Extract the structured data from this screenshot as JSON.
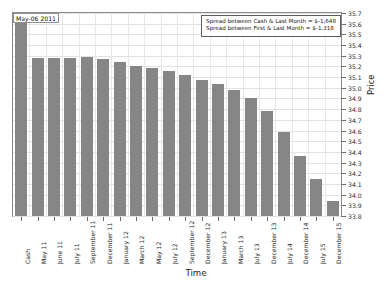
{
  "chart_data": {
    "type": "bar",
    "title": "",
    "xlabel": "Time",
    "ylabel": "Price",
    "ylim": [
      33.8,
      35.7
    ],
    "ytick_step": 0.1,
    "grid": true,
    "legend_position": "none",
    "bar_color": "#868686",
    "categories": [
      "Cash",
      "May 11",
      "June 11",
      "July 11",
      "September 11",
      "December 11",
      "January 12",
      "March 12",
      "May 12",
      "July 12",
      "September 12",
      "December 12",
      "January 13",
      "March 13",
      "July 13",
      "December 13",
      "July 14",
      "December 14",
      "July 15",
      "December 15"
    ],
    "values": [
      35.62,
      35.28,
      35.28,
      35.28,
      35.29,
      35.27,
      35.24,
      35.2,
      35.19,
      35.16,
      35.12,
      35.07,
      35.04,
      34.98,
      34.9,
      34.78,
      34.59,
      34.36,
      34.15,
      33.94
    ],
    "ytick_labels": [
      "35.7",
      "35.6",
      "35.5",
      "35.4",
      "35.3",
      "35.2",
      "35.1",
      "35.0",
      "34.9",
      "34.8",
      "34.7",
      "34.6",
      "34.5",
      "34.4",
      "34.3",
      "34.2",
      "34.1",
      "34.0",
      "33.9",
      "33.8"
    ]
  },
  "annotations": {
    "date_label": "May-06 2011",
    "box_lines": [
      "Spread between Cash & Last Month = $-1,648",
      "Spread between First & Last Month = $-1,318"
    ]
  }
}
